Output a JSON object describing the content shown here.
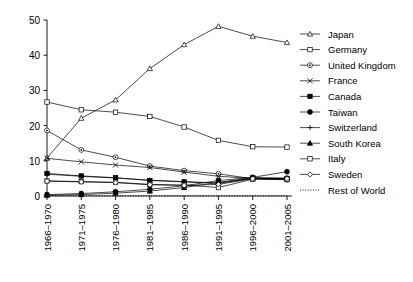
{
  "chart_data": {
    "type": "line",
    "title": "",
    "xlabel": "",
    "ylabel": "",
    "ylim": [
      0,
      50
    ],
    "yticks": [
      0,
      10,
      20,
      30,
      40,
      50
    ],
    "grid": false,
    "legend_position": "right",
    "categories": [
      "1966–1970",
      "1971–1975",
      "1976–1980",
      "1981–1985",
      "1986–1990",
      "1991–1995",
      "1996–2000",
      "2001–2005"
    ],
    "series": [
      {
        "name": "Japan",
        "marker": "triangle-open",
        "values": [
          10.8,
          22.1,
          27.3,
          36.2,
          43.0,
          48.2,
          45.4,
          43.6
        ]
      },
      {
        "name": "Germany",
        "marker": "square-open",
        "values": [
          26.7,
          24.5,
          23.8,
          22.6,
          19.6,
          15.8,
          14.0,
          13.9
        ]
      },
      {
        "name": "United Kingdom",
        "marker": "circle-dot",
        "values": [
          18.6,
          13.1,
          11.0,
          8.5,
          7.2,
          6.3,
          4.9,
          4.6
        ]
      },
      {
        "name": "France",
        "marker": "x-cross",
        "values": [
          10.7,
          9.7,
          8.8,
          8.1,
          6.8,
          5.6,
          5.0,
          4.7
        ]
      },
      {
        "name": "Canada",
        "marker": "square-filled",
        "values": [
          6.4,
          5.7,
          5.2,
          4.4,
          4.0,
          3.6,
          5.1,
          5.0
        ]
      },
      {
        "name": "Taiwan",
        "marker": "circle-filled",
        "values": [
          0.4,
          0.7,
          1.2,
          1.9,
          2.9,
          4.4,
          5.3,
          6.9
        ]
      },
      {
        "name": "Switzerland",
        "marker": "plus-cross",
        "values": [
          6.2,
          5.6,
          5.1,
          4.5,
          4.1,
          3.7,
          5.0,
          4.9
        ]
      },
      {
        "name": "South Korea",
        "marker": "triangle-filled",
        "values": [
          0.2,
          0.4,
          0.8,
          1.4,
          2.4,
          3.9,
          5.2,
          5.1
        ]
      },
      {
        "name": "Italy",
        "marker": "square-open-sm",
        "values": [
          4.3,
          4.1,
          3.9,
          3.3,
          3.1,
          2.4,
          4.8,
          4.8
        ]
      },
      {
        "name": "Sweden",
        "marker": "diamond-open",
        "values": [
          4.2,
          4.0,
          3.8,
          3.2,
          3.0,
          3.3,
          4.9,
          4.9
        ]
      },
      {
        "name": "Rest of World",
        "marker": "dotted-line",
        "values": [
          0.08,
          0.08,
          0.08,
          0.08,
          0.08,
          0.08,
          0.08,
          0.08
        ]
      }
    ]
  },
  "legend": {
    "items": [
      {
        "label": "Japan"
      },
      {
        "label": "Germany"
      },
      {
        "label": "United Kingdom"
      },
      {
        "label": "France"
      },
      {
        "label": "Canada"
      },
      {
        "label": "Taiwan"
      },
      {
        "label": "Switzerland"
      },
      {
        "label": "South Korea"
      },
      {
        "label": "Italy"
      },
      {
        "label": "Sweden"
      },
      {
        "label": "Rest of World"
      }
    ]
  },
  "axes": {
    "y_tick_labels": [
      "0",
      "10",
      "20",
      "30",
      "40",
      "50"
    ],
    "x_tick_labels": [
      "1966–1970",
      "1971–1975",
      "1976–1980",
      "1981–1985",
      "1986–1990",
      "1991–1995",
      "1996–2000",
      "2001–2005"
    ]
  },
  "colors": {
    "ink": "#000000",
    "background": "#ffffff"
  }
}
